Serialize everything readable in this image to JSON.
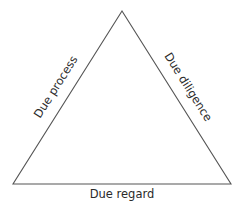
{
  "diagram": {
    "type": "triangle",
    "line_color": "#555555",
    "text_color": "#2b2b2b",
    "vertices": {
      "apex": [
        122,
        11
      ],
      "bottom_left": [
        13,
        184
      ],
      "bottom_right": [
        231,
        184
      ]
    },
    "labels": {
      "left_side": "Due process",
      "right_side": "Due diligence",
      "base": "Due regard"
    }
  }
}
